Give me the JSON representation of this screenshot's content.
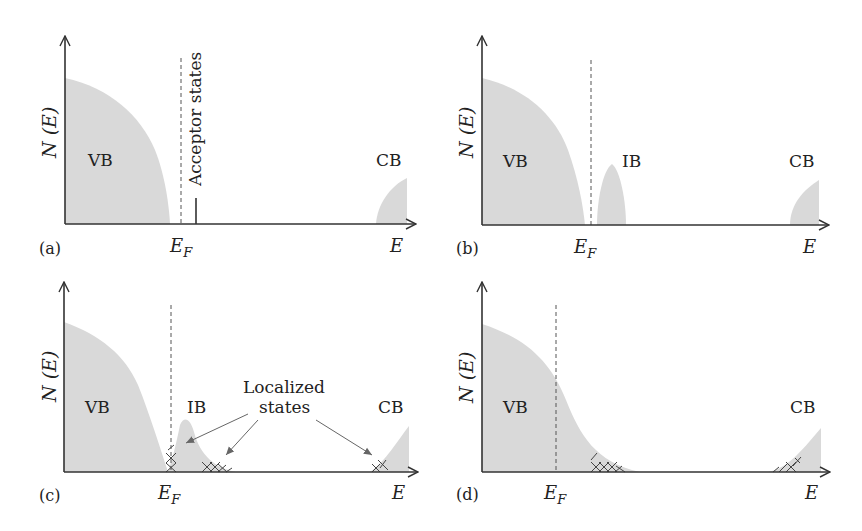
{
  "figure": {
    "panels": [
      {
        "id": "a",
        "panel_label": "(a)",
        "y_axis_label": "N (E)",
        "x_axis_label": "E",
        "fermi_label": "E_F",
        "bands": [
          "VB",
          "CB"
        ],
        "annotation": "Acceptor states"
      },
      {
        "id": "b",
        "panel_label": "(b)",
        "y_axis_label": "N (E)",
        "x_axis_label": "E",
        "fermi_label": "E_F",
        "bands": [
          "VB",
          "IB",
          "CB"
        ]
      },
      {
        "id": "c",
        "panel_label": "(c)",
        "y_axis_label": "N (E)",
        "x_axis_label": "E",
        "fermi_label": "E_F",
        "bands": [
          "VB",
          "IB",
          "CB"
        ],
        "annotation_line1": "Localized",
        "annotation_line2": "states"
      },
      {
        "id": "d",
        "panel_label": "(d)",
        "y_axis_label": "N (E)",
        "x_axis_label": "E",
        "fermi_label": "E_F",
        "bands": [
          "VB",
          "CB"
        ]
      }
    ],
    "colors": {
      "band_fill": "#d9d9d9",
      "axis": "#333333",
      "dashed": "#555555"
    }
  }
}
